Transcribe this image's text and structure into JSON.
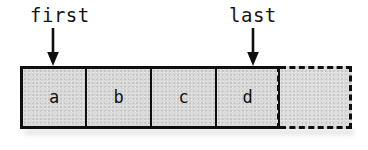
{
  "figure": {
    "background_color": "#ffffff",
    "cell_fill_color": "#d9d9d9",
    "stroke_color": "#0f0f0f"
  },
  "pointers": [
    {
      "label": "first",
      "target_cell": "a",
      "arrow_direction": "down"
    },
    {
      "label": "last",
      "target_cell": "d",
      "arrow_direction": "down"
    }
  ],
  "array": {
    "cells": [
      {
        "value": "a",
        "style": "solid"
      },
      {
        "value": "b",
        "style": "solid"
      },
      {
        "value": "c",
        "style": "solid"
      },
      {
        "value": "d",
        "style": "solid"
      },
      {
        "value": "",
        "style": "dashed"
      }
    ]
  }
}
